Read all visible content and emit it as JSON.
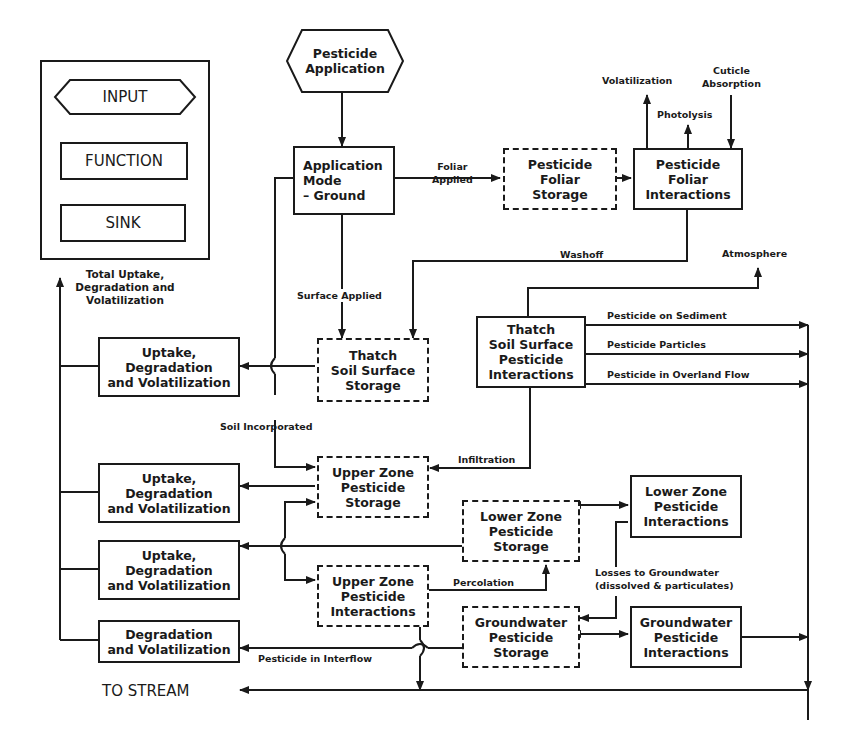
{
  "legend": {
    "input": "INPUT",
    "function": "FUNCTION",
    "sink": "SINK"
  },
  "nodes": {
    "pesticide_application": "Pesticide\nApplication",
    "application_mode": "Application\nMode\n  – Ground",
    "foliar_storage": "Pesticide\nFoliar\nStorage",
    "foliar_interactions": "Pesticide\nFoliar\nInteractions",
    "thatch_storage": "Thatch\nSoil Surface\nStorage",
    "thatch_interactions": "Thatch\nSoil Surface\nPesticide\nInteractions",
    "upper_storage": "Upper Zone\nPesticide\nStorage",
    "upper_interactions": "Upper Zone\nPesticide\nInteractions",
    "lower_storage": "Lower Zone\nPesticide\nStorage",
    "lower_interactions": "Lower Zone\nPesticide\nInteractions",
    "gw_storage": "Groundwater\nPesticide\nStorage",
    "gw_interactions": "Groundwater\nPesticide\nInteractions",
    "uptake_1": "Uptake,\nDegradation\nand Volatilization",
    "uptake_2": "Uptake,\nDegradation\nand Volatilization",
    "uptake_3": "Uptake,\nDegradation\nand Volatilization",
    "degradation": "Degradation\nand Volatilization"
  },
  "labels": {
    "total_uptake": "Total Uptake,\nDegradation and\nVolatilization",
    "foliar_applied": "Foliar\nApplied",
    "volatilization": "Volatilization",
    "photolysis": "Photolysis",
    "cuticle_absorption": "Cuticle\nAbsorption",
    "washoff": "Washoff",
    "atmosphere": "Atmosphere",
    "surface_applied": "Surface Applied",
    "soil_incorporated": "Soil Incorporated",
    "infiltration": "Infiltration",
    "pesticide_on_sediment": "Pesticide on Sediment",
    "pesticide_particles": "Pesticide Particles",
    "pesticide_overland": "Pesticide in Overland Flow",
    "percolation": "Percolation",
    "losses_to_groundwater": "Losses to Groundwater\n(dissolved & particulates)",
    "pesticide_interflow": "Pesticide in Interflow",
    "to_stream": "TO STREAM"
  }
}
